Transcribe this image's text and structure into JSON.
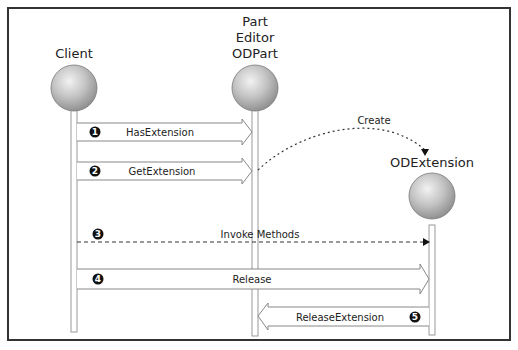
{
  "participants": [
    {
      "id": "client",
      "title_lines": [
        "Client"
      ],
      "x": 74
    },
    {
      "id": "odpart",
      "title_lines": [
        "Part",
        "Editor",
        "ODPart"
      ],
      "x": 255
    },
    {
      "id": "odextension",
      "title_lines": [
        "ODExtension"
      ],
      "x": 432
    }
  ],
  "messages": [
    {
      "step": "1",
      "label": "HasExtension",
      "from": "Client",
      "to": "ODPart",
      "style": "hollow-arrow"
    },
    {
      "step": "2",
      "label": "GetExtension",
      "from": "Client",
      "to": "ODPart",
      "style": "hollow-arrow"
    },
    {
      "step": "",
      "label": "Create",
      "from": "ODPart",
      "to": "ODExtension",
      "style": "dotted-curve"
    },
    {
      "step": "3",
      "label": "Invoke Methods",
      "from": "Client",
      "to": "ODExtension",
      "style": "dashed-arrow"
    },
    {
      "step": "4",
      "label": "Release",
      "from": "Client",
      "to": "ODExtension",
      "style": "hollow-arrow"
    },
    {
      "step": "5",
      "label": "ReleaseExtension",
      "from": "ODExtension",
      "to": "ODPart",
      "style": "hollow-arrow"
    }
  ],
  "colors": {
    "frame": "#333333",
    "lifeline": "#999999",
    "sphere": "#bdbdbd",
    "text": "#222222"
  }
}
